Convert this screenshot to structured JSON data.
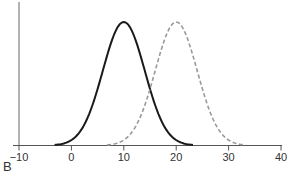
{
  "panel_label": "B",
  "chart_data": {
    "type": "line",
    "title": "",
    "xlabel": "",
    "ylabel": "",
    "xlim": [
      -10,
      40
    ],
    "x_ticks": [
      -10,
      0,
      10,
      20,
      30,
      40
    ],
    "x_tick_labels": [
      "−10",
      "0",
      "10",
      "20",
      "30",
      "40"
    ],
    "grid": false,
    "legend": null,
    "series": [
      {
        "name": "distribution-1",
        "style": "solid",
        "color": "#1a1a1a",
        "mean": 10,
        "sd": 4
      },
      {
        "name": "distribution-2",
        "style": "dashed",
        "color": "#999999",
        "mean": 20,
        "sd": 4
      }
    ]
  }
}
